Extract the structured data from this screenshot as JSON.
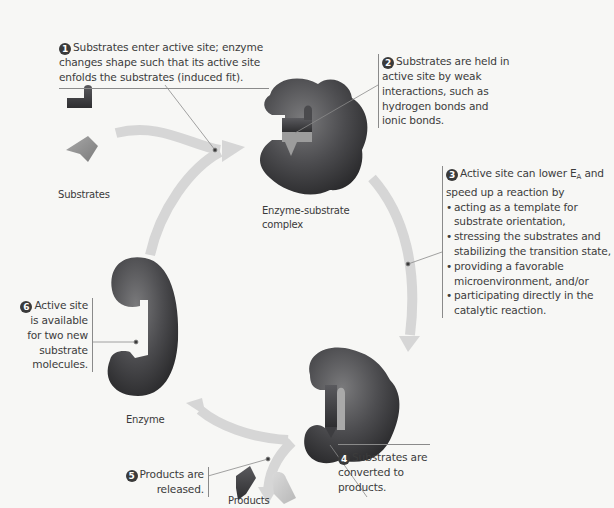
{
  "diagram": {
    "type": "enzyme catalytic cycle",
    "colors": {
      "background": "#f7f7f5",
      "enzyme": "#4a4a4c",
      "arrow": "#d6d6d6",
      "substrate_dark": "#3d3d40",
      "substrate_light": "#b9b9b9",
      "callout_line": "#8a8a8a"
    },
    "steps": [
      {
        "num": "1",
        "text": "Substrates enter active site; enzyme changes shape such that its active site enfolds the substrates (induced fit)."
      },
      {
        "num": "2",
        "text": "Substrates are held in active site by weak interactions, such as hydrogen bonds and ionic bonds."
      },
      {
        "num": "3",
        "intro": "Active site can lower E",
        "intro_sub": "A",
        "intro_tail": " and speed up a reaction by",
        "bullets": [
          "acting as a template for substrate orientation,",
          "stressing the substrates and stabilizing the transition state,",
          "providing a favorable microenvironment, and/or",
          "participating directly in the catalytic reaction."
        ]
      },
      {
        "num": "4",
        "text": "Substrates are converted to products."
      },
      {
        "num": "5",
        "text": "Products are released."
      },
      {
        "num": "6",
        "text": "Active site is available for two new substrate molecules."
      }
    ],
    "labels": {
      "substrates": "Substrates",
      "complex_line1": "Enzyme-substrate",
      "complex_line2": "complex",
      "enzyme": "Enzyme",
      "products": "Products"
    }
  }
}
